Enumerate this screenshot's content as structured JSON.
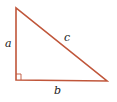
{
  "diagram": {
    "type": "right-triangle",
    "stroke_color": "#c0563a",
    "vertices": {
      "top": [
        16,
        8
      ],
      "right_angle": [
        16,
        80
      ],
      "right": [
        107,
        81
      ]
    },
    "labels": {
      "a": "a",
      "b": "b",
      "c": "c"
    },
    "right_angle_marker": true
  }
}
